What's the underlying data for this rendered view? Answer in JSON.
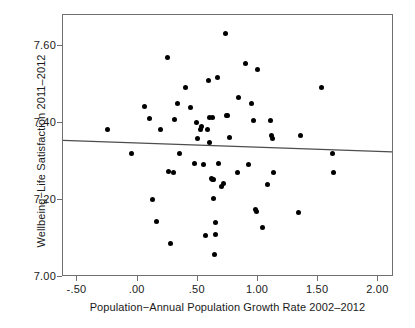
{
  "chart_data": {
    "type": "scatter",
    "title": "",
    "subtitle": "",
    "xlabel": "Population−Annual Population Growth Rate 2002–2012",
    "ylabel": "Wellbeing−Life Satisfaction 2011–2012",
    "xlim": [
      -0.62,
      2.13
    ],
    "ylim": [
      7.0,
      7.68
    ],
    "xticks": [
      -0.5,
      0.0,
      0.5,
      1.0,
      1.5,
      2.0
    ],
    "xticklabels": [
      "-.50",
      ".00",
      ".50",
      "1.00",
      "1.50",
      "2.00"
    ],
    "yticks": [
      7.0,
      7.2,
      7.4,
      7.6
    ],
    "yticklabels": [
      "7.00",
      "7.20",
      "7.40",
      "7.60"
    ],
    "grid": false,
    "legend": null,
    "marker_color": "#000000",
    "frame_color": "#6f6f6f",
    "text_color": "#1a1a1a",
    "fit_line": {
      "type": "linear-regression",
      "color": "#4d4d4d",
      "x_start": -0.62,
      "y_start": 7.352,
      "x_end": 2.13,
      "y_end": 7.322,
      "slope": -0.011,
      "intercept": 7.345
    },
    "points": [
      [
        -0.25,
        7.383
      ],
      [
        -0.05,
        7.32
      ],
      [
        0.06,
        7.443
      ],
      [
        0.1,
        7.411
      ],
      [
        0.12,
        7.2
      ],
      [
        0.16,
        7.143
      ],
      [
        0.19,
        7.383
      ],
      [
        0.25,
        7.57
      ],
      [
        0.26,
        7.273
      ],
      [
        0.27,
        7.086
      ],
      [
        0.3,
        7.272
      ],
      [
        0.31,
        7.41
      ],
      [
        0.33,
        7.45
      ],
      [
        0.35,
        7.32
      ],
      [
        0.4,
        7.493
      ],
      [
        0.44,
        7.44
      ],
      [
        0.47,
        7.294
      ],
      [
        0.49,
        7.4
      ],
      [
        0.5,
        7.36
      ],
      [
        0.52,
        7.383
      ],
      [
        0.53,
        7.39
      ],
      [
        0.55,
        7.292
      ],
      [
        0.56,
        7.108
      ],
      [
        0.58,
        7.382
      ],
      [
        0.59,
        7.511
      ],
      [
        0.6,
        7.348
      ],
      [
        0.6,
        7.415
      ],
      [
        0.61,
        7.256
      ],
      [
        0.62,
        7.414
      ],
      [
        0.62,
        7.254
      ],
      [
        0.63,
        7.253
      ],
      [
        0.63,
        7.205
      ],
      [
        0.64,
        7.058
      ],
      [
        0.65,
        7.11
      ],
      [
        0.65,
        7.142
      ],
      [
        0.66,
        7.518
      ],
      [
        0.67,
        7.294
      ],
      [
        0.7,
        7.236
      ],
      [
        0.71,
        7.243
      ],
      [
        0.73,
        7.633
      ],
      [
        0.74,
        7.42
      ],
      [
        0.75,
        7.418
      ],
      [
        0.76,
        7.362
      ],
      [
        0.83,
        7.271
      ],
      [
        0.84,
        7.466
      ],
      [
        0.9,
        7.553
      ],
      [
        0.92,
        7.293
      ],
      [
        0.95,
        7.45
      ],
      [
        0.96,
        7.405
      ],
      [
        0.98,
        7.175
      ],
      [
        0.99,
        7.17
      ],
      [
        1.0,
        7.538
      ],
      [
        1.04,
        7.128
      ],
      [
        1.08,
        7.24
      ],
      [
        1.1,
        7.405
      ],
      [
        1.11,
        7.367
      ],
      [
        1.12,
        7.36
      ],
      [
        1.13,
        7.271
      ],
      [
        1.34,
        7.168
      ],
      [
        1.35,
        7.367
      ],
      [
        1.53,
        7.492
      ],
      [
        1.62,
        7.32
      ],
      [
        1.63,
        7.27
      ]
    ]
  },
  "axes": {
    "x_tick_labels": [
      "-.50",
      ".00",
      ".50",
      "1.00",
      "1.50",
      "2.00"
    ],
    "y_tick_labels": [
      "7.60",
      "7.40",
      "7.20",
      "7.00"
    ],
    "x_title": "Population−Annual Population Growth Rate 2002–2012",
    "y_title": "Wellbeing−Life Satisfaction 2011–2012"
  }
}
